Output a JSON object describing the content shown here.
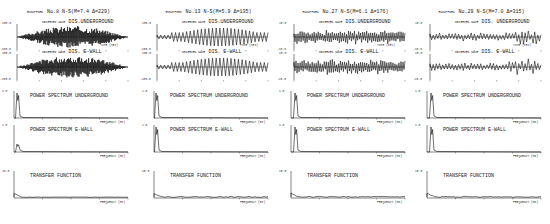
{
  "figure": {
    "columns": [
      {
        "header_prefix": "RUNUPFORD",
        "header": "No.8 N-S(M=7.4 Δ=229)",
        "panels": {
          "dis_underground": {
            "tag": "OBSERVED WAVE",
            "label": "DIS.UNDERGROUND",
            "ytick_top": "100.0",
            "ytick_bottom": "-100.0",
            "xlabel": "TIME (SEC)"
          },
          "dis_ewall": {
            "tag": "OBSERVED WAVE",
            "label": "DIS. E-WALL",
            "ytick_top": "100.0",
            "ytick_bottom": "-100.0"
          },
          "ps_underground": {
            "label": "POWER SPECTRUM UNDERGROUND",
            "ytick_top": "1.0",
            "xlabel": "FREQUENCY (HZ)"
          },
          "ps_ewall": {
            "label": "POWER SPECTRUM E-WALL",
            "ytick_top": "1.0",
            "xlabel": "FREQUENCY (HZ)"
          },
          "transfer": {
            "label": "TRANSFER FUNCTION",
            "ytick_top": "10.0",
            "xlabel": "FREQUENCY (HZ)"
          }
        }
      },
      {
        "header_prefix": "RUNUPFORD",
        "header": "No.13 N-S(M=5.9 Δ=135)",
        "panels": {
          "dis_underground": {
            "tag": "OBSERVED WAVE",
            "label": "DIS.UNDERGROUND",
            "ytick_top": "100.0",
            "ytick_bottom": "-100.0",
            "xlabel": "TIME (SEC)"
          },
          "dis_ewall": {
            "tag": "OBSERVED WAVE",
            "label": "DIS. E-WALL",
            "ytick_top": "100.0",
            "ytick_bottom": "-100.0"
          },
          "ps_underground": {
            "label": "POWER SPECTRUM UNDERGROUND",
            "ytick_top": "1.0",
            "xlabel": "FREQUENCY (HZ)"
          },
          "ps_ewall": {
            "label": "POWER SPECTRUM E-WALL",
            "ytick_top": "1.0",
            "xlabel": "FREQUENCY (HZ)"
          },
          "transfer": {
            "label": "TRANSFER FUNCTION",
            "ytick_top": "10.0",
            "xlabel": "FREQUENCY (HZ)"
          }
        }
      },
      {
        "header_prefix": "RUNUPFORD",
        "header": "No.27 N-S(M=6.1 Δ=176)",
        "panels": {
          "dis_underground": {
            "tag": "OBSERVED WAVE",
            "label": "DIS.UNDERGROUND",
            "ytick_top": "10.0",
            "ytick_bottom": "-10.0",
            "xlabel": "TIME (SEC)"
          },
          "dis_ewall": {
            "tag": "OBSERVED WAVE",
            "label": "DIS. E-WALL",
            "ytick_top": "10.0",
            "ytick_bottom": "-10.0"
          },
          "ps_underground": {
            "label": "POWER SPECTRUM UNDERGROUND",
            "ytick_top": "1.0",
            "xlabel": "FREQUENCY (HZ)"
          },
          "ps_ewall": {
            "label": "POWER SPECTRUM E-WALL",
            "ytick_top": "1.0",
            "xlabel": "FREQUENCY (HZ)"
          },
          "transfer": {
            "label": "TRANSFER FUNCTION",
            "ytick_top": "10.0",
            "xlabel": "FREQUENCY (HZ)"
          }
        }
      },
      {
        "header_prefix": "RUNUPFORD",
        "header": "No.29 N-S(M=7.0 Δ=315)",
        "panels": {
          "dis_underground": {
            "tag": "OBSERVED WAVE",
            "label": "DIS. UNDERGROUND",
            "ytick_top": "10.0",
            "ytick_bottom": "-10.0",
            "xlabel": "TIME (SEC)"
          },
          "dis_ewall": {
            "tag": "OBSERVED WAVE",
            "label": "DIS. E-WALL",
            "ytick_top": "10.0",
            "ytick_bottom": "-10.0"
          },
          "ps_underground": {
            "label": "POWER SPECTRUM UNDERGROUND",
            "ytick_top": "1.0",
            "xlabel": "FREQUENCY (HZ)"
          },
          "ps_ewall": {
            "label": "POWER SPECTRUM E-WALL",
            "ytick_top": "1.0",
            "xlabel": "FREQUENCY (HZ)"
          },
          "transfer": {
            "label": "TRANSFER FUNCTION",
            "ytick_top": "10.0",
            "xlabel": "FREQUENCY (HZ)"
          }
        }
      }
    ]
  },
  "chart_data": [
    {
      "type": "line",
      "title": "No.8 N-S(M=7.4 Δ=229)",
      "panels": [
        {
          "title": "DIS.UNDERGROUND",
          "xlabel": "TIME (SEC)",
          "ylim": [
            -100,
            100
          ],
          "description": "dense high-frequency displacement record"
        },
        {
          "title": "DIS. E-WALL",
          "ylim": [
            -100,
            100
          ]
        },
        {
          "title": "POWER SPECTRUM UNDERGROUND",
          "xlabel": "FREQUENCY (HZ)",
          "ylim": [
            0,
            1.0
          ],
          "x_ticks": [
            0,
            5,
            10,
            15,
            20
          ],
          "peak_hz": 0.6
        },
        {
          "title": "POWER SPECTRUM E-WALL",
          "xlabel": "FREQUENCY (HZ)",
          "ylim": [
            0,
            1.0
          ],
          "x_ticks": [
            0,
            5,
            10,
            15,
            20
          ],
          "peak_hz": 0.6
        },
        {
          "title": "TRANSFER FUNCTION",
          "xlabel": "FREQUENCY (HZ)",
          "ylim": [
            0,
            10.0
          ],
          "x_ticks": [
            0,
            5,
            10,
            15,
            20
          ]
        }
      ]
    },
    {
      "type": "line",
      "title": "No.13 N-S(M=5.9 Δ=135)",
      "panels": [
        {
          "title": "DIS.UNDERGROUND",
          "xlabel": "TIME (SEC)",
          "ylim": [
            -100,
            100
          ],
          "description": "low-frequency oscillating displacement"
        },
        {
          "title": "DIS. E-WALL",
          "ylim": [
            -100,
            100
          ]
        },
        {
          "title": "POWER SPECTRUM UNDERGROUND",
          "xlabel": "FREQUENCY (HZ)",
          "ylim": [
            0,
            1.0
          ],
          "x_ticks": [
            0,
            5,
            10,
            15,
            20
          ],
          "peak_hz": 0.5
        },
        {
          "title": "POWER SPECTRUM E-WALL",
          "xlabel": "FREQUENCY (HZ)",
          "ylim": [
            0,
            1.0
          ],
          "x_ticks": [
            0,
            5,
            10,
            15,
            20
          ],
          "peak_hz": 0.5
        },
        {
          "title": "TRANSFER FUNCTION",
          "xlabel": "FREQUENCY (HZ)",
          "ylim": [
            0,
            10.0
          ],
          "x_ticks": [
            0,
            5,
            10,
            15,
            20
          ]
        }
      ]
    },
    {
      "type": "line",
      "title": "No.27 N-S(M=6.1 Δ=176)",
      "panels": [
        {
          "title": "DIS.UNDERGROUND",
          "xlabel": "TIME (SEC)",
          "ylim": [
            -10,
            10
          ]
        },
        {
          "title": "DIS. E-WALL",
          "ylim": [
            -10,
            10
          ]
        },
        {
          "title": "POWER SPECTRUM UNDERGROUND",
          "xlabel": "FREQUENCY (HZ)",
          "ylim": [
            0,
            1.0
          ],
          "x_ticks": [
            0,
            5,
            10,
            15,
            20
          ],
          "peak_hz": 0.8
        },
        {
          "title": "POWER SPECTRUM E-WALL",
          "xlabel": "FREQUENCY (HZ)",
          "ylim": [
            0,
            1.0
          ],
          "x_ticks": [
            0,
            5,
            10,
            15,
            20
          ],
          "peak_hz": 0.8
        },
        {
          "title": "TRANSFER FUNCTION",
          "xlabel": "FREQUENCY (HZ)",
          "ylim": [
            0,
            10.0
          ],
          "x_ticks": [
            0,
            5,
            10,
            15,
            20
          ]
        }
      ]
    },
    {
      "type": "line",
      "title": "No.29 N-S(M=7.0 Δ=315)",
      "panels": [
        {
          "title": "DIS. UNDERGROUND",
          "xlabel": "TIME (SEC)",
          "ylim": [
            -10,
            10
          ]
        },
        {
          "title": "DIS. E-WALL",
          "ylim": [
            -10,
            10
          ]
        },
        {
          "title": "POWER SPECTRUM UNDERGROUND",
          "xlabel": "FREQUENCY (HZ)",
          "ylim": [
            0,
            1.0
          ],
          "x_ticks": [
            0,
            5,
            10,
            15,
            20
          ],
          "peak_hz": 0.5
        },
        {
          "title": "POWER SPECTRUM E-WALL",
          "xlabel": "FREQUENCY (HZ)",
          "ylim": [
            0,
            1.0
          ],
          "x_ticks": [
            0,
            5,
            10,
            15,
            20
          ],
          "peak_hz": 0.5
        },
        {
          "title": "TRANSFER FUNCTION",
          "xlabel": "FREQUENCY (HZ)",
          "ylim": [
            0,
            10.0
          ],
          "x_ticks": [
            0,
            5,
            10,
            15,
            20
          ]
        }
      ]
    }
  ]
}
